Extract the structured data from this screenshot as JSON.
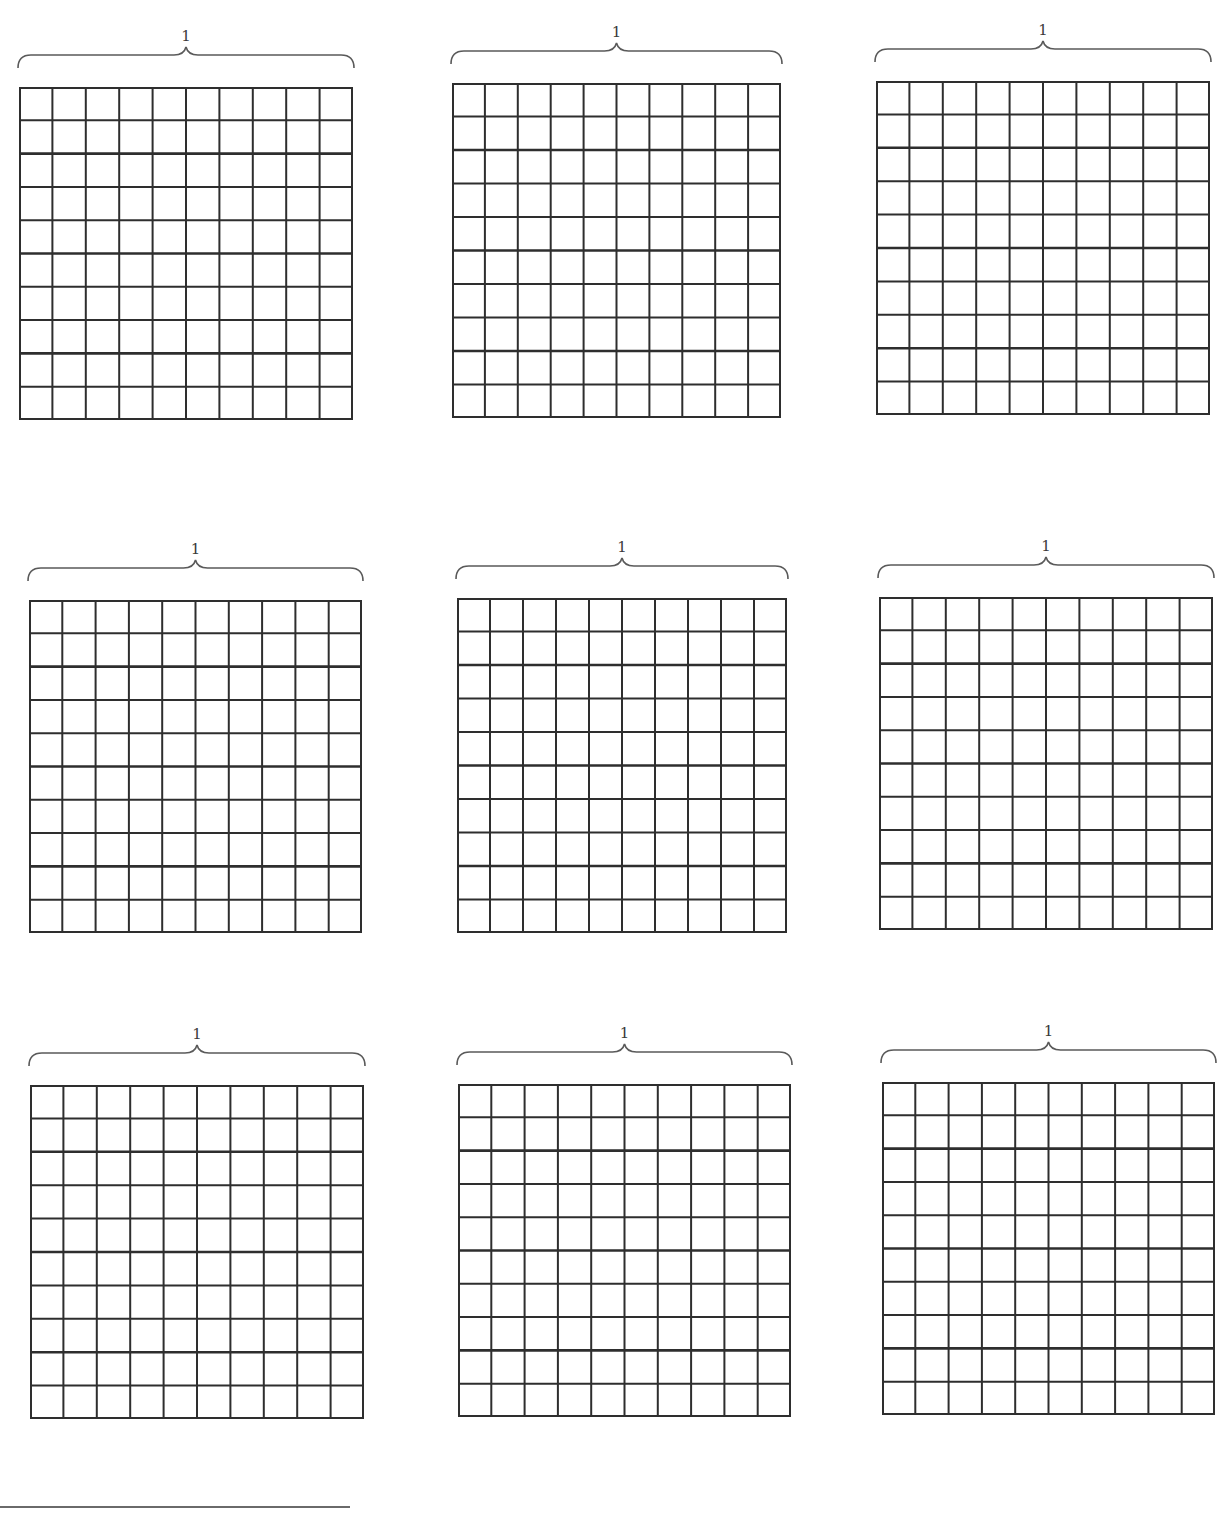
{
  "worksheet": {
    "grid_rows": 10,
    "grid_cols": 10,
    "line_color": "#2e2e2e",
    "brace_color": "#5a5a5a",
    "panels": [
      {
        "label": "1",
        "x": 19,
        "y": 87,
        "w": 334,
        "h": 333
      },
      {
        "label": "1",
        "x": 452,
        "y": 83,
        "w": 329,
        "h": 335
      },
      {
        "label": "1",
        "x": 876,
        "y": 81,
        "w": 334,
        "h": 334
      },
      {
        "label": "1",
        "x": 29,
        "y": 600,
        "w": 333,
        "h": 333
      },
      {
        "label": "1",
        "x": 457,
        "y": 598,
        "w": 330,
        "h": 335
      },
      {
        "label": "1",
        "x": 879,
        "y": 597,
        "w": 334,
        "h": 333
      },
      {
        "label": "1",
        "x": 30,
        "y": 1085,
        "w": 334,
        "h": 334
      },
      {
        "label": "1",
        "x": 458,
        "y": 1084,
        "w": 333,
        "h": 333
      },
      {
        "label": "1",
        "x": 882,
        "y": 1082,
        "w": 333,
        "h": 333
      }
    ]
  },
  "footer": {
    "answer_line": ""
  }
}
